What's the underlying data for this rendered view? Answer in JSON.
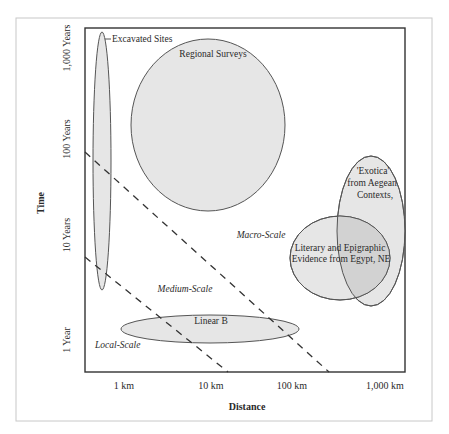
{
  "diagram": {
    "type": "spatio-temporal scale diagram",
    "x_axis": {
      "title": "Distance",
      "ticks": [
        "1 km",
        "10 km",
        "100 km",
        "1,000 km"
      ]
    },
    "y_axis": {
      "title": "Time",
      "ticks": [
        "1 Year",
        "10 Years",
        "100 Years",
        "1,000 Years"
      ]
    },
    "scale_zones": [
      "Local-Scale",
      "Medium-Scale",
      "Macro-Scale"
    ],
    "regions": [
      {
        "id": "excavated-sites",
        "label": "Excavated Sites"
      },
      {
        "id": "regional-surveys",
        "label": "Regional Surveys"
      },
      {
        "id": "exotica",
        "label_lines": [
          "'Exotica'",
          "from Aegean",
          "Contexts,"
        ]
      },
      {
        "id": "literary-evidence",
        "label_lines": [
          "Literary and Epigraphic",
          "Evidence from Egypt, NE"
        ]
      },
      {
        "id": "linear-b",
        "label": "Linear B"
      }
    ],
    "colors": {
      "ellipse_fill": "#e6e6e6",
      "overlap_fill": "#d2d2d2",
      "stroke": "#555555",
      "frame": "#333333",
      "outer_frame": "#c8c8c8"
    }
  }
}
